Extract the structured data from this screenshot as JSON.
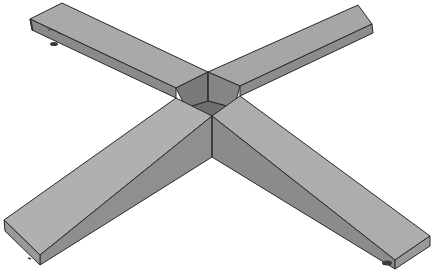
{
  "image": {
    "subject": "Cross-shaped beam base (3D render)",
    "background": "#ffffff",
    "colors": {
      "top_face": "#a8a8a8",
      "top_face_light": "#b4b4b4",
      "side_face": "#8e8e8e",
      "side_face_dark": "#7c7c7c",
      "end_face": "#9a9a9a",
      "center_dark": "#6f6f6f",
      "edge": "#2a2a2a",
      "foot": "#3a3a3a"
    }
  }
}
